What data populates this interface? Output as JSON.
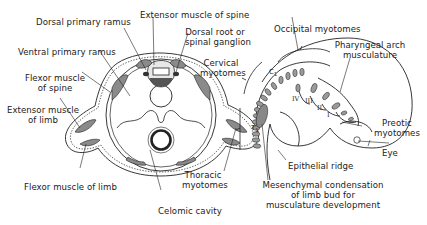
{
  "figure": {
    "panels": [
      {
        "id": "cross-section",
        "labels": {
          "dorsal_primary_ramus": "Dorsal primary ramus",
          "extensor_muscle_of_spine": "Extensor muscle of spine",
          "dorsal_root_line1": "Dorsal root or",
          "dorsal_root_line2": "spinal ganglion",
          "ventral_primary_ramus": "Ventral primary ramus",
          "flexor_spine_line1": "Flexor muscle",
          "flexor_spine_line2": "of spine",
          "extensor_limb_line1": "Extensor muscle",
          "extensor_limb_line2": "of limb",
          "flexor_muscle_of_limb": "Flexor muscle of limb",
          "celomic_cavity": "Celomic cavity"
        }
      },
      {
        "id": "embryo",
        "labels": {
          "occipital_myotomes": "Occipital myotomes",
          "pharyngeal_line1": "Pharyngeal arch",
          "pharyngeal_line2": "musculature",
          "cervical_line1": "Cervical",
          "cervical_line2": "myotomes",
          "thoracic_line1": "Thoracic",
          "thoracic_line2": "myotomes",
          "preotic_line1": "Preotic",
          "preotic_line2": "myotomes",
          "eye": "Eye",
          "epithelial_ridge": "Epithelial ridge",
          "mesenchymal_line1": "Mesenchymal condensation",
          "mesenchymal_line2": "of limb bud for",
          "mesenchymal_line3": "musculature development"
        },
        "inline_marks": {
          "c1": "C",
          "c1_sub": "1",
          "t1": "T",
          "t1_sub": "1",
          "arch_iv": "IV",
          "arch_iii": "III",
          "arch_ii": "II",
          "arch_i": "I"
        }
      }
    ],
    "colors": {
      "ink": "#222222",
      "muscle_fill": "#8a8a8a",
      "myotome_fill": "#9a9a9a",
      "background": "#ffffff"
    }
  }
}
